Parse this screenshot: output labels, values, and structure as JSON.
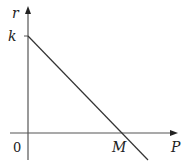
{
  "diagram": {
    "type": "line-graph",
    "axes": {
      "y_label": "r",
      "x_label": "P",
      "origin_label": "0"
    },
    "labels": {
      "y_intercept": "k",
      "x_intercept": "M"
    },
    "line": {
      "description": "straight decreasing line from (0,k) through (M,0)",
      "color": "#333333"
    },
    "colors": {
      "axis": "#555555",
      "line": "#333333",
      "text": "#222222"
    }
  }
}
